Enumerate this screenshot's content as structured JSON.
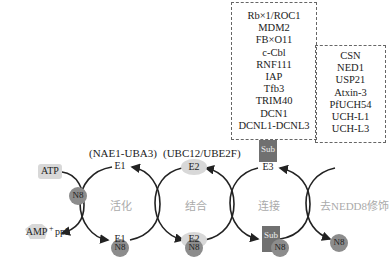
{
  "e3_ligases": {
    "items": [
      "Rb×1/ROC1",
      "MDM2",
      "FB×O11",
      "c-Cbl",
      "RNF111",
      "IAP",
      "Tfb3",
      "TRIM40",
      "DCN1",
      "DCNL1-DCNL3"
    ]
  },
  "deneddylases": {
    "items": [
      "CSN",
      "NED1",
      "USP21",
      "Atxin-3",
      "PfUCH54",
      "UCH-L1",
      "UCH-L3"
    ]
  },
  "enzymes": {
    "e1_label": "(NAE1-UBA3)",
    "e2_label": "(UBC12/UBE2F)",
    "e1": "E1",
    "e2": "E2",
    "e3": "E3",
    "sub": "Sub",
    "n8": "N8"
  },
  "reagents": {
    "atp": "ATP",
    "amp": "AMP",
    "plus": "+",
    "ppi": "ppi"
  },
  "stages": {
    "activation": "活化",
    "conjugation": "结合",
    "ligation": "连接",
    "deneddylation": "去NEDD8修饰"
  },
  "colors": {
    "n8_fill": "#8c8c8c",
    "e_fill": "#d8d8d8",
    "sub_fill": "#707070",
    "arrow": "#222222",
    "stage_text": "#aaaaaa"
  }
}
